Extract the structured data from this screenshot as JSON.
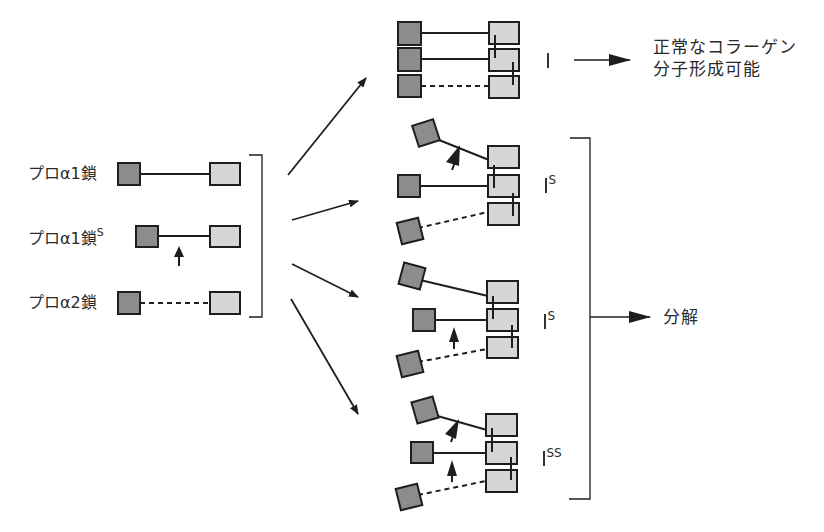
{
  "colors": {
    "dark_box": "#8c8c8c",
    "light_box": "#d6d6d6",
    "stroke": "#1e1e1e"
  },
  "left_chains": [
    {
      "label": "プロα1鎖",
      "superscript": "",
      "line": "solid",
      "mutation_arrow": false
    },
    {
      "label": "プロα1鎖",
      "superscript": "S",
      "line": "solid",
      "mutation_arrow": true
    },
    {
      "label": "プロα2鎖",
      "superscript": "",
      "line": "dashed",
      "mutation_arrow": false
    }
  ],
  "groups": [
    {
      "type_label": "I",
      "superscript": "",
      "outcome": "正常なコラーゲン分子形成可能"
    },
    {
      "type_label": "I",
      "superscript": "S",
      "outcome": "分解"
    },
    {
      "type_label": "I",
      "superscript": "S",
      "outcome": "分解"
    },
    {
      "type_label": "I",
      "superscript": "SS",
      "outcome": "分解"
    }
  ],
  "outcomes": {
    "normal_line1": "正常なコラーゲン",
    "normal_line2": "分子形成可能",
    "degradation": "分解"
  }
}
